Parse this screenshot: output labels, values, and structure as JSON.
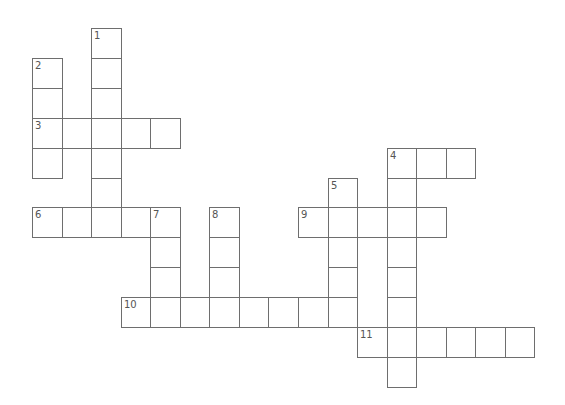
{
  "puzzle": {
    "type": "crossword",
    "grid": {
      "origin_x": 32,
      "origin_y": 28,
      "cell_w": 29.55,
      "cell_h": 29.9,
      "border_color": "#6e6e6e",
      "number_color": "#555555"
    },
    "entries": [
      {
        "number": "1",
        "direction": "down",
        "col": 2,
        "row": 0,
        "length": 7
      },
      {
        "number": "2",
        "direction": "down",
        "col": 0,
        "row": 1,
        "length": 4
      },
      {
        "number": "3",
        "direction": "across",
        "col": 0,
        "row": 3,
        "length": 5
      },
      {
        "number": "4",
        "direction": "across",
        "col": 12,
        "row": 4,
        "length": 3
      },
      {
        "number": "4",
        "direction": "down",
        "col": 12,
        "row": 4,
        "length": 8
      },
      {
        "number": "5",
        "direction": "down",
        "col": 10,
        "row": 5,
        "length": 5
      },
      {
        "number": "6",
        "direction": "across",
        "col": 0,
        "row": 6,
        "length": 5
      },
      {
        "number": "7",
        "direction": "down",
        "col": 4,
        "row": 6,
        "length": 4
      },
      {
        "number": "8",
        "direction": "down",
        "col": 6,
        "row": 6,
        "length": 4
      },
      {
        "number": "9",
        "direction": "across",
        "col": 9,
        "row": 6,
        "length": 5
      },
      {
        "number": "10",
        "direction": "across",
        "col": 3,
        "row": 9,
        "length": 8
      },
      {
        "number": "11",
        "direction": "across",
        "col": 11,
        "row": 10,
        "length": 6
      }
    ]
  }
}
